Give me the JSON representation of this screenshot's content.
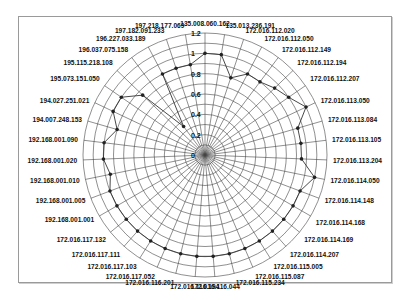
{
  "chart_data": {
    "type": "radar",
    "title": "",
    "radial_axis": {
      "min": 0,
      "max": 1.2,
      "ticks": [
        "0",
        "0.2",
        "0.4",
        "0.6",
        "0.8",
        "1",
        "1.2"
      ]
    },
    "grid": true,
    "legend": "none",
    "categories": [
      "135.008.060.162",
      "135.013.236.191",
      "172.016.112.020",
      "172.016.112.050",
      "172.016.112.149",
      "172.016.112.194",
      "172.016.112.207",
      "172.016.113.050",
      "172.016.113.084",
      "172.016.113.105",
      "172.016.113.204",
      "172.016.114.050",
      "172.016.114.148",
      "172.016.114.168",
      "172.016.114.169",
      "172.016.114.207",
      "172.016.115.005",
      "172.016.115.087",
      "172.016.115.234",
      "172.016.116.044",
      "172.016.116.194",
      "172.016.116.201",
      "172.016.117.052",
      "172.016.117.103",
      "172.016.117.111",
      "172.016.117.132",
      "192.168.001.001",
      "192.168.001.005",
      "192.168.001.010",
      "192.168.001.020",
      "192.168.001.090",
      "194.007.248.153",
      "194.027.251.021",
      "195.073.151.050",
      "195.115.218.108",
      "196.037.075.158",
      "196.227.033.189",
      "197.182.091.233",
      "197.218.177.069"
    ],
    "series": [
      {
        "name": "series-1",
        "values": [
          1.0,
          1.0,
          0.8,
          0.9,
          0.9,
          0.95,
          1.0,
          1.1,
          0.95,
          0.95,
          0.95,
          1.1,
          1.0,
          1.0,
          1.0,
          1.0,
          1.0,
          1.0,
          1.0,
          1.0,
          1.0,
          1.0,
          1.0,
          1.0,
          1.0,
          1.0,
          1.0,
          1.0,
          0.95,
          1.0,
          1.0,
          0.9,
          1.0,
          1.0,
          0.85,
          0.35,
          0.9,
          0.9,
          0.9
        ]
      }
    ]
  },
  "style": {
    "line_color": "#333333",
    "grid_color": "#444444",
    "marker_color": "#222222"
  }
}
